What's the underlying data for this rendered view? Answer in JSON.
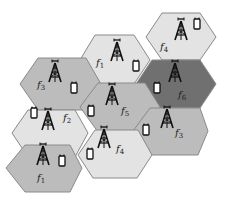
{
  "diagram": {
    "colors": {
      "stroke": "#8a8a8a",
      "light": "#e3e3e3",
      "medium": "#bcbcbc",
      "dark": "#707070",
      "icon": "#111111"
    },
    "cells": [
      {
        "id": "cell-f4-top",
        "label": "f",
        "sub": "4",
        "shade": "light",
        "points": "162,13 200,13 216,37 200,60 162,60 146,37",
        "tower": [
          181,
          30
        ],
        "phone": [
          197,
          24
        ],
        "text": [
          160,
          50
        ]
      },
      {
        "id": "cell-f1-top",
        "label": "f",
        "sub": "1",
        "shade": "light",
        "points": "95,35 134,35 150,60 134,84 95,84 80,60",
        "tower": [
          117,
          51
        ],
        "phone": [
          136,
          66
        ],
        "text": [
          96,
          66
        ]
      },
      {
        "id": "cell-f3-left",
        "label": "f",
        "sub": "3",
        "shade": "medium",
        "points": "38,58 86,58 101,84 86,110 38,110 20,84",
        "tower": [
          55,
          72
        ],
        "phone": [
          74,
          88
        ],
        "text": [
          37,
          88
        ]
      },
      {
        "id": "cell-f6",
        "label": "f",
        "sub": "6",
        "shade": "dark",
        "points": "152,60 200,60 216,84 200,108 152,108 136,84",
        "tower": [
          175,
          72
        ],
        "phone": [
          157,
          88
        ],
        "text": [
          178,
          98
        ]
      },
      {
        "id": "cell-f5",
        "label": "f",
        "sub": "5",
        "shade": "medium",
        "points": "98,83 145,83 160,107 145,132 98,132 80,107",
        "tower": [
          112,
          95
        ],
        "phone": [
          91,
          111
        ],
        "text": [
          121,
          114
        ]
      },
      {
        "id": "cell-f2",
        "label": "f",
        "sub": "2",
        "shade": "light",
        "points": "28,110 75,110 88,133 75,157 28,157 12,133",
        "tower": [
          48,
          120
        ],
        "phone": [
          34,
          113
        ],
        "text": [
          63,
          121
        ]
      },
      {
        "id": "cell-f3-right",
        "label": "f",
        "sub": "3",
        "shade": "medium",
        "points": "150,108 200,108 208,131 198,155 145,155 133,131",
        "tower": [
          167,
          118
        ],
        "phone": [
          146,
          130
        ],
        "text": [
          175,
          136
        ]
      },
      {
        "id": "cell-f4-bottom",
        "label": "f",
        "sub": "4",
        "shade": "light",
        "points": "95,130 138,130 152,155 137,178 93,178 78,155",
        "tower": [
          104,
          138
        ],
        "phone": [
          90,
          154
        ],
        "text": [
          116,
          152
        ]
      },
      {
        "id": "cell-f1-bottom",
        "label": "f",
        "sub": "1",
        "shade": "medium",
        "points": "25,145 70,145 82,168 70,192 25,192 6,168",
        "tower": [
          43,
          155
        ],
        "phone": [
          62,
          161
        ],
        "text": [
          37,
          181
        ]
      }
    ]
  }
}
